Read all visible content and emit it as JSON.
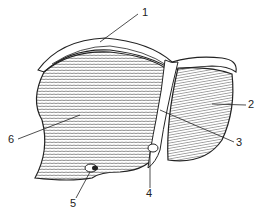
{
  "diagram": {
    "labels": [
      {
        "id": "1",
        "text": "1",
        "x": 142,
        "y": 16
      },
      {
        "id": "2",
        "text": "2",
        "x": 250,
        "y": 108
      },
      {
        "id": "3",
        "text": "3",
        "x": 238,
        "y": 145
      },
      {
        "id": "4",
        "text": "4",
        "x": 148,
        "y": 197
      },
      {
        "id": "5",
        "text": "5",
        "x": 73,
        "y": 207
      },
      {
        "id": "6",
        "text": "6",
        "x": 10,
        "y": 142
      }
    ],
    "colors": {
      "ink": "#222222",
      "background": "#ffffff",
      "shade": "#d8d8d8"
    }
  }
}
